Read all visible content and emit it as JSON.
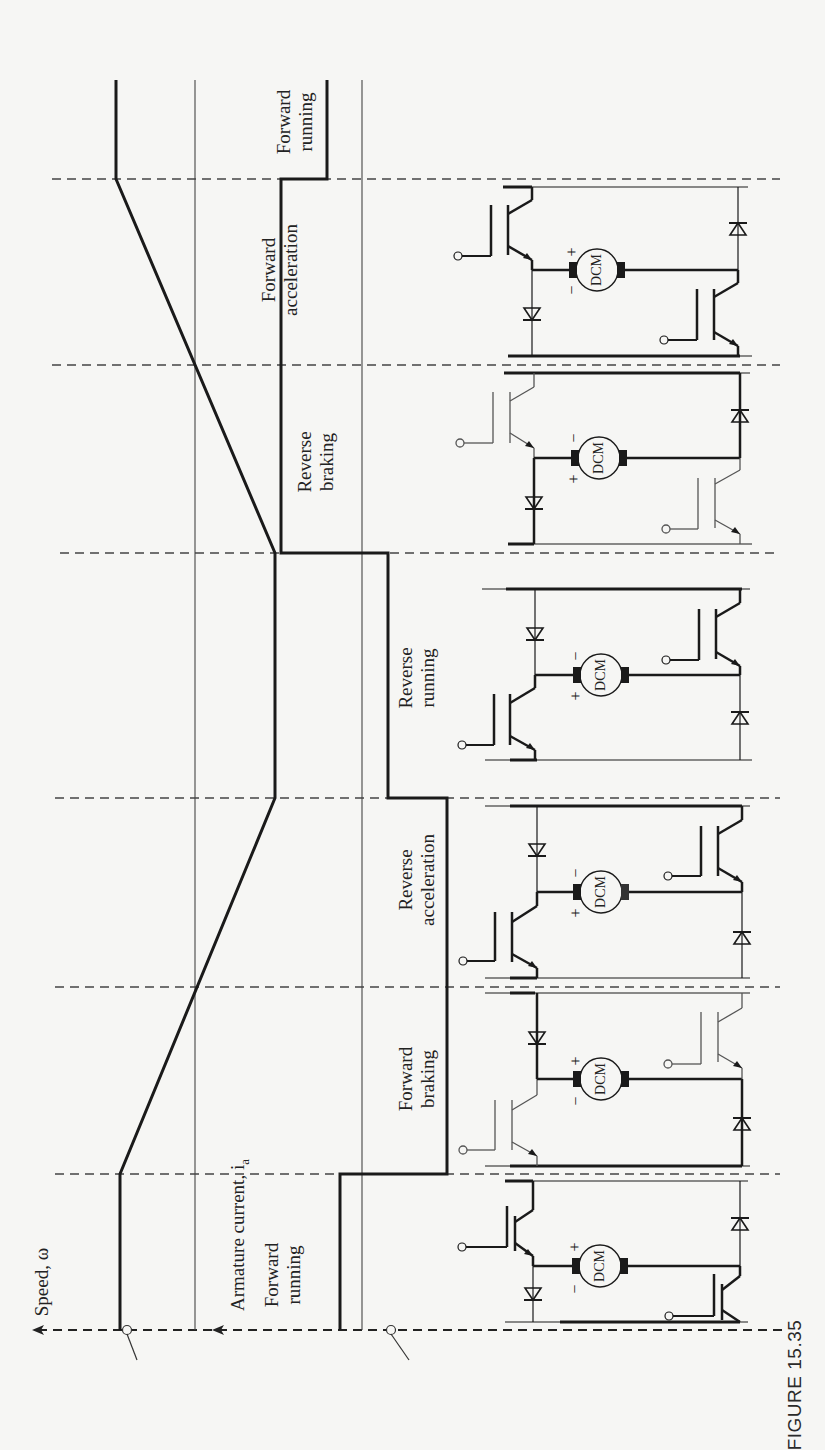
{
  "figure": {
    "caption": "FIGURE 15.35",
    "orientation": "rotated 90° counter-clockwise; time axis runs bottom-to-top",
    "colors": {
      "background": "#f6f6f4",
      "ink": "#1a1a1a",
      "grid": "#444444",
      "inactive_device": "#555555"
    }
  },
  "axes": {
    "speed_label": "Speed, ω",
    "current_label": "Armature current, i",
    "current_subscript": "a"
  },
  "modes": [
    {
      "id": "forward-running-start",
      "line1": "Forward",
      "line2": "running",
      "speed": "+ constant",
      "current": "+ small",
      "motor_polarity": [
        "+",
        "−"
      ]
    },
    {
      "id": "forward-braking",
      "line1": "Forward",
      "line2": "braking",
      "speed": "+ decreasing",
      "current": "− large",
      "motor_polarity": [
        "+",
        "−"
      ]
    },
    {
      "id": "reverse-acceleration",
      "line1": "Reverse",
      "line2": "acceleration",
      "speed": "− increasing magnitude",
      "current": "− large",
      "motor_polarity": [
        "−",
        "+"
      ]
    },
    {
      "id": "reverse-running",
      "line1": "Reverse",
      "line2": "running",
      "speed": "− constant",
      "current": "− small",
      "motor_polarity": [
        "−",
        "+"
      ]
    },
    {
      "id": "reverse-braking",
      "line1": "Reverse",
      "line2": "braking",
      "speed": "− decreasing magnitude",
      "current": "+ large",
      "motor_polarity": [
        "−",
        "+"
      ]
    },
    {
      "id": "forward-acceleration",
      "line1": "Forward",
      "line2": "acceleration",
      "speed": "+ increasing",
      "current": "+ large",
      "motor_polarity": [
        "+",
        "−"
      ]
    },
    {
      "id": "forward-running-end",
      "line1": "Forward",
      "line2": "running",
      "speed": "+ constant",
      "current": "+ small",
      "motor_polarity": null
    }
  ],
  "circuit": {
    "motor_label": "DCM",
    "plus": "+",
    "minus": "−"
  }
}
